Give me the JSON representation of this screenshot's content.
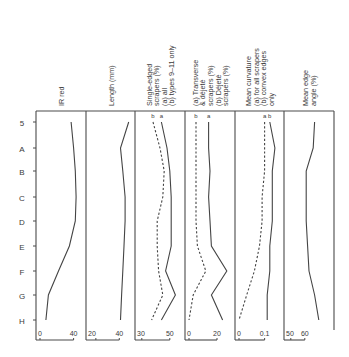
{
  "chart_data": {
    "type": "line",
    "title": "",
    "orientation": "vertical-profile",
    "row_axis": {
      "label": "",
      "categories": [
        "5",
        "A",
        "B",
        "C",
        "D",
        "E",
        "F",
        "G",
        "H"
      ]
    },
    "panels": [
      {
        "id": "ir_red",
        "header": [
          "IR red"
        ],
        "xlim": [
          0,
          50
        ],
        "ticks": [
          "0",
          "40"
        ],
        "tick_values": [
          0,
          40
        ],
        "series": [
          {
            "name": "IR red",
            "style": "solid",
            "label": "",
            "values": [
              37,
              40,
              42,
              43,
              42,
              35,
              22,
              10,
              7
            ]
          }
        ]
      },
      {
        "id": "length",
        "header": [
          "Length (mm)"
        ],
        "xlim": [
          15,
          50
        ],
        "ticks": [
          "20",
          "40"
        ],
        "tick_values": [
          20,
          40
        ],
        "series": [
          {
            "name": "Length",
            "style": "solid",
            "label": "",
            "values": [
              48,
              41,
              43,
              45,
              45,
              44,
              43,
              42,
              41
            ]
          }
        ]
      },
      {
        "id": "single_edged",
        "header": [
          "Single-edged",
          "scrapers (%)",
          "(a) all",
          "(b) types 9–11 only"
        ],
        "xlim": [
          28,
          58
        ],
        "ticks": [
          "30",
          "50"
        ],
        "tick_values": [
          30,
          50
        ],
        "series": [
          {
            "name": "(a) all",
            "style": "solid",
            "label": "a",
            "values": [
              44,
              48,
              50,
              51,
              51,
              51,
              47,
              54,
              44
            ]
          },
          {
            "name": "(b) types 9–11 only",
            "style": "dashed",
            "label": "b",
            "values": [
              38,
              43,
              46,
              45,
              41,
              41,
              42,
              45,
              37
            ]
          }
        ]
      },
      {
        "id": "transverse_delete",
        "header": [
          "(a) Transverse",
          "& déjeté",
          "scrapers (%)",
          "(b) Déjeté",
          "scrapers (%)"
        ],
        "xlim": [
          0,
          30
        ],
        "ticks": [
          "0",
          "20"
        ],
        "tick_values": [
          0,
          20
        ],
        "series": [
          {
            "name": "(a) Transverse & déjeté scrapers (%)",
            "style": "solid",
            "label": "a",
            "values": [
              14,
              14,
              15,
              14,
              15,
              16,
              27,
              16,
              24
            ]
          },
          {
            "name": "(b) Déjeté scrapers (%)",
            "style": "dashed",
            "label": "b",
            "values": [
              5,
              5,
              5,
              5,
              5,
              6,
              12,
              3,
              0
            ]
          }
        ]
      },
      {
        "id": "mean_curvature",
        "header": [
          "Mean curvature",
          "(a) for all scrapers",
          "(b) convex edges",
          "only"
        ],
        "xlim": [
          0,
          0.16
        ],
        "ticks": [
          "0",
          "0.1"
        ],
        "tick_values": [
          0,
          0.1
        ],
        "series": [
          {
            "name": "(a) for all scrapers",
            "style": "dashed",
            "label": "a",
            "values": [
              0.1,
              0.1,
              0.1,
              0.09,
              0.09,
              0.08,
              0.06,
              0.03,
              0.0
            ]
          },
          {
            "name": "(b) convex edges only",
            "style": "solid",
            "label": "b",
            "values": [
              0.12,
              0.14,
              0.13,
              0.13,
              0.13,
              0.12,
              0.12,
              0.11,
              0.11
            ]
          }
        ]
      },
      {
        "id": "mean_edge_angle",
        "header": [
          "Mean edge",
          "angle (%)"
        ],
        "xlim": [
          48,
          78
        ],
        "ticks": [
          "50",
          "60"
        ],
        "tick_values": [
          50,
          60
        ],
        "series": [
          {
            "name": "Mean edge angle",
            "style": "solid",
            "label": "",
            "values": [
              67,
              66,
              61,
              61,
              61,
              62,
              63,
              67,
              70
            ]
          }
        ]
      }
    ],
    "grid": false,
    "legend": "inline series labels a / b at top of each panel"
  }
}
